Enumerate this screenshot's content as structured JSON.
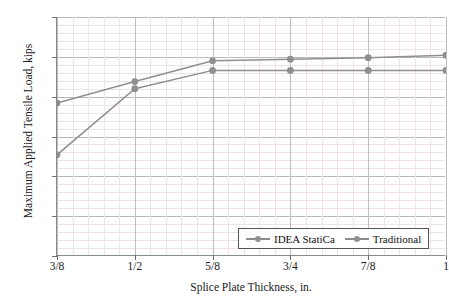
{
  "chart_data": {
    "type": "line",
    "title": "",
    "xlabel": "Splice Plate Thickness, in.",
    "ylabel": "Maximum Applied Tensile Load, kips",
    "categories": [
      "3/8",
      "1/2",
      "5/8",
      "3/4",
      "7/8",
      "1"
    ],
    "x_numeric": [
      0.375,
      0.5,
      0.625,
      0.75,
      0.875,
      1.0
    ],
    "xlim": [
      0.375,
      1.0
    ],
    "ylim": [
      0,
      300
    ],
    "y_ticks": [
      0,
      50,
      100,
      150,
      200,
      250,
      300
    ],
    "grid": true,
    "minor_grid": true,
    "legend_position": "bottom-right",
    "series": [
      {
        "name": "IDEA StatiCa",
        "color": "#8f8f8f",
        "marker": "circle",
        "values": [
          127,
          210,
          233,
          233,
          233,
          233
        ]
      },
      {
        "name": "Traditional",
        "color": "#8f8f8f",
        "marker": "circle",
        "values": [
          192,
          219,
          245,
          247,
          249,
          252
        ]
      }
    ]
  },
  "axes": {
    "y_tick_labels": [
      "300",
      "250",
      "200",
      "150",
      "100",
      "50",
      "0"
    ],
    "x_tick_labels": [
      "3/8",
      "1/2",
      "5/8",
      "3/4",
      "7/8",
      "1"
    ]
  },
  "legend": {
    "items": [
      {
        "label": "IDEA StatiCa"
      },
      {
        "label": "Traditional"
      }
    ]
  }
}
